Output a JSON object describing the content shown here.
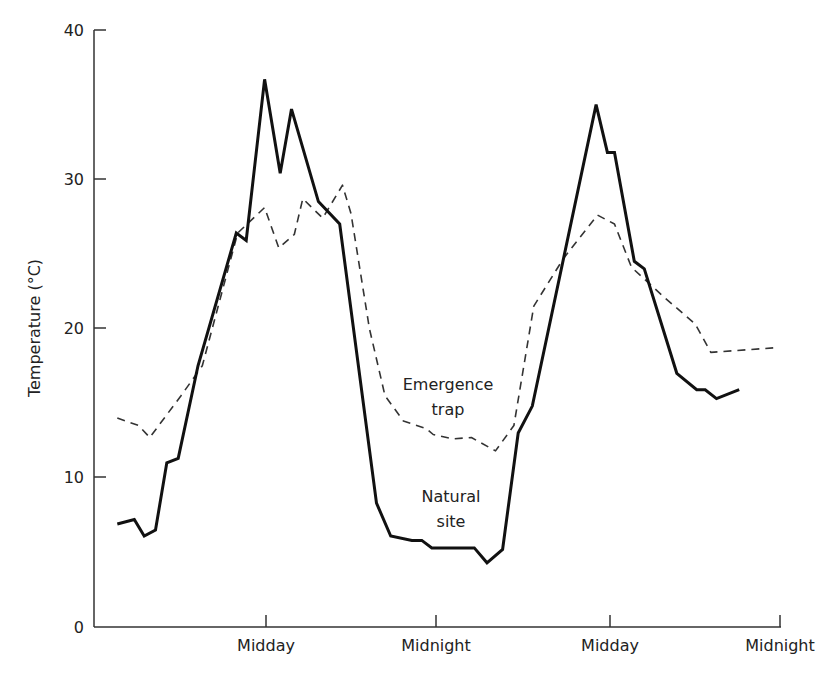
{
  "chart_data": {
    "type": "line",
    "title": "",
    "xlabel": "",
    "ylabel": "Temperature (°C)",
    "ylim": [
      0,
      40
    ],
    "yticks": [
      0,
      10,
      20,
      30,
      40
    ],
    "xticks": [
      {
        "label": "Midday",
        "x": 12
      },
      {
        "label": "Midnight",
        "x": 24
      },
      {
        "label": "Midday",
        "x": 36
      },
      {
        "label": "Midnight",
        "x": 48
      }
    ],
    "x_unit": "hours (approx, from start of record)",
    "grid": false,
    "legend": "inline annotations",
    "annotations": [
      {
        "text_lines": [
          "Emergence",
          "trap"
        ],
        "series": "Emergence trap"
      },
      {
        "text_lines": [
          "Natural",
          "site"
        ],
        "series": "Natural site"
      }
    ],
    "series": [
      {
        "name": "Natural site",
        "style": "solid",
        "color": "#111111",
        "points": [
          [
            1.5,
            6.9
          ],
          [
            2.7,
            7.2
          ],
          [
            3.4,
            6.1
          ],
          [
            4.2,
            6.5
          ],
          [
            5.0,
            11.0
          ],
          [
            5.8,
            11.3
          ],
          [
            7.2,
            17.5
          ],
          [
            9.9,
            26.4
          ],
          [
            10.6,
            25.9
          ],
          [
            11.9,
            36.7
          ],
          [
            13.0,
            30.4
          ],
          [
            13.8,
            34.7
          ],
          [
            15.7,
            28.5
          ],
          [
            17.2,
            27.0
          ],
          [
            19.8,
            8.3
          ],
          [
            20.8,
            6.1
          ],
          [
            22.3,
            5.8
          ],
          [
            23.0,
            5.8
          ],
          [
            23.7,
            5.3
          ],
          [
            25.0,
            5.3
          ],
          [
            26.7,
            5.3
          ],
          [
            27.6,
            4.3
          ],
          [
            28.7,
            5.2
          ],
          [
            29.8,
            13.0
          ],
          [
            30.8,
            14.8
          ],
          [
            35.3,
            35.0
          ],
          [
            36.1,
            31.8
          ],
          [
            36.6,
            31.8
          ],
          [
            38.0,
            24.5
          ],
          [
            38.7,
            24.0
          ],
          [
            41.0,
            17.0
          ],
          [
            42.4,
            15.9
          ],
          [
            43.0,
            15.9
          ],
          [
            43.8,
            15.3
          ],
          [
            45.4,
            15.9
          ]
        ]
      },
      {
        "name": "Emergence trap",
        "style": "dashed",
        "color": "#333333",
        "points": [
          [
            1.5,
            14.0
          ],
          [
            3.0,
            13.5
          ],
          [
            3.8,
            12.7
          ],
          [
            6.0,
            15.5
          ],
          [
            7.5,
            17.5
          ],
          [
            10.0,
            26.4
          ],
          [
            11.9,
            28.1
          ],
          [
            12.9,
            25.4
          ],
          [
            14.0,
            26.3
          ],
          [
            14.6,
            28.7
          ],
          [
            16.0,
            27.4
          ],
          [
            17.4,
            29.6
          ],
          [
            18.0,
            27.7
          ],
          [
            19.3,
            20.0
          ],
          [
            20.4,
            15.5
          ],
          [
            21.7,
            13.8
          ],
          [
            23.3,
            13.3
          ],
          [
            23.8,
            12.9
          ],
          [
            25.2,
            12.6
          ],
          [
            26.5,
            12.7
          ],
          [
            28.2,
            11.8
          ],
          [
            29.5,
            13.5
          ],
          [
            30.9,
            21.5
          ],
          [
            33.0,
            24.7
          ],
          [
            35.4,
            27.6
          ],
          [
            36.6,
            27.0
          ],
          [
            37.8,
            24.1
          ],
          [
            40.1,
            22.1
          ],
          [
            42.3,
            20.3
          ],
          [
            43.4,
            18.4
          ],
          [
            47.8,
            18.7
          ]
        ]
      }
    ]
  },
  "axes": {
    "y_label": "Temperature (°C)",
    "y_ticks": [
      "0",
      "10",
      "20",
      "30",
      "40"
    ],
    "x_ticks": [
      "Midday",
      "Midnight",
      "Midday",
      "Midnight"
    ]
  },
  "labels": {
    "trap_line1": "Emergence",
    "trap_line2": "trap",
    "natural_line1": "Natural",
    "natural_line2": "site"
  }
}
